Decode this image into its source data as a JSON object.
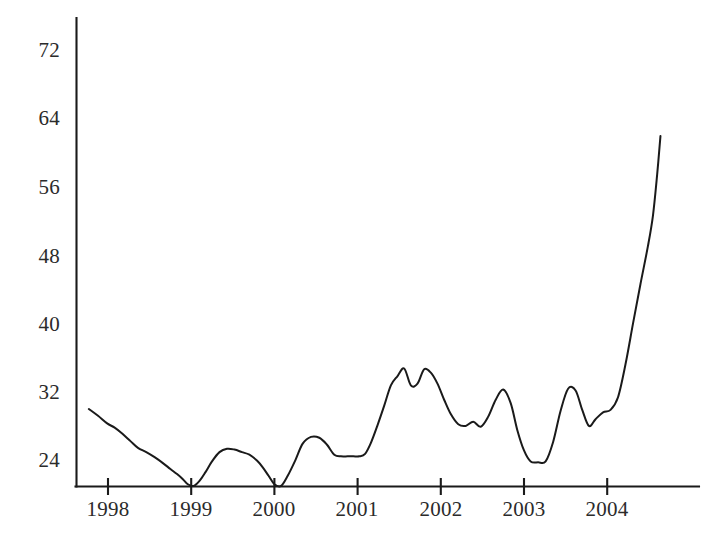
{
  "chart_data": {
    "type": "line",
    "title": "",
    "subtitle": "",
    "xlabel": "",
    "ylabel": "",
    "grid": false,
    "legend": null,
    "xlim": [
      1997.75,
      2004.65
    ],
    "ylim": [
      20.0,
      74.0
    ],
    "y_ticks": [
      24,
      32,
      40,
      48,
      56,
      64,
      72
    ],
    "y_tick_labels": [
      "24",
      "32",
      "40",
      "48",
      "56",
      "64",
      "72"
    ],
    "x_ticks": [
      1998,
      1999,
      2000,
      2001,
      2002,
      2003,
      2004
    ],
    "x_tick_labels": [
      "1998",
      "1999",
      "2000",
      "2001",
      "2002",
      "2003",
      "2004"
    ],
    "line_color": "#1a1a1a",
    "series": [
      {
        "name": "value",
        "x": [
          1997.77,
          1997.88,
          1997.99,
          1998.08,
          1998.17,
          1998.27,
          1998.36,
          1998.46,
          1998.56,
          1998.66,
          1998.75,
          1998.83,
          1998.9,
          1998.96,
          1999.03,
          1999.1,
          1999.17,
          1999.25,
          1999.34,
          1999.43,
          1999.52,
          1999.61,
          1999.7,
          1999.79,
          1999.86,
          1999.93,
          2000.0,
          2000.08,
          2000.16,
          2000.25,
          2000.34,
          2000.44,
          2000.54,
          2000.63,
          2000.72,
          2000.8,
          2000.88,
          2000.95,
          2001.02,
          2001.09,
          2001.16,
          2001.24,
          2001.32,
          2001.4,
          2001.48,
          2001.56,
          2001.64,
          2001.72,
          2001.8,
          2001.88,
          2001.96,
          2002.04,
          2002.12,
          2002.21,
          2002.3,
          2002.39,
          2002.48,
          2002.57,
          2002.66,
          2002.75,
          2002.84,
          2002.92,
          2003.0,
          2003.08,
          2003.17,
          2003.26,
          2003.35,
          2003.44,
          2003.53,
          2003.62,
          2003.7,
          2003.78,
          2003.86,
          2003.95,
          2004.04,
          2004.13,
          2004.22,
          2004.31,
          2004.4,
          2004.49,
          2004.58
        ],
        "y": [
          29.5,
          28.7,
          27.8,
          27.3,
          26.6,
          25.7,
          24.9,
          24.4,
          23.8,
          23.1,
          22.4,
          21.8,
          21.2,
          20.6,
          20.4,
          21.0,
          22.0,
          23.3,
          24.4,
          24.8,
          24.7,
          24.4,
          24.1,
          23.4,
          22.6,
          21.6,
          20.6,
          20.4,
          21.6,
          23.4,
          25.4,
          26.2,
          26.1,
          25.3,
          24.1,
          23.9,
          23.9,
          23.9,
          23.9,
          24.2,
          25.5,
          27.6,
          29.9,
          32.3,
          33.4,
          34.3,
          32.3,
          32.5,
          34.2,
          33.8,
          32.5,
          30.6,
          28.9,
          27.7,
          27.5,
          28.0,
          27.4,
          28.6,
          30.6,
          31.8,
          30.2,
          27.0,
          24.6,
          23.3,
          23.2,
          23.3,
          25.6,
          29.3,
          31.9,
          31.7,
          29.4,
          27.5,
          28.3,
          29.1,
          29.4,
          30.9,
          34.8,
          39.6,
          44.3,
          48.8,
          52.4
        ],
        "x_extra": [
          2004.62,
          2004.66,
          2004.7
        ],
        "y_extra": [
          56.2,
          58.1,
          62.0
        ]
      }
    ],
    "full_x": [
      1997.77,
      1997.88,
      1997.99,
      1998.08,
      1998.17,
      1998.27,
      1998.36,
      1998.46,
      1998.56,
      1998.66,
      1998.75,
      1998.83,
      1998.9,
      1998.96,
      1999.03,
      1999.1,
      1999.17,
      1999.25,
      1999.34,
      1999.43,
      1999.52,
      1999.61,
      1999.7,
      1999.79,
      1999.86,
      1999.93,
      2000.0,
      2000.08,
      2000.16,
      2000.25,
      2000.34,
      2000.44,
      2000.54,
      2000.63,
      2000.72,
      2000.8,
      2000.88,
      2000.95,
      2001.02,
      2001.09,
      2001.16,
      2001.24,
      2001.32,
      2001.4,
      2001.48,
      2001.56,
      2001.64,
      2001.72,
      2001.8,
      2001.88,
      2001.96,
      2002.04,
      2002.12,
      2002.21,
      2002.3,
      2002.39,
      2002.48,
      2002.57,
      2002.66,
      2002.75,
      2002.84,
      2002.92,
      2003.0,
      2003.08,
      2003.17,
      2003.26,
      2003.35,
      2003.44,
      2003.53,
      2003.62,
      2003.7,
      2003.78,
      2003.86,
      2003.95,
      2004.04,
      2004.13,
      2004.22,
      2004.31,
      2004.4,
      2004.49,
      2004.55,
      2004.6,
      2004.64
    ],
    "full_y": [
      29.5,
      28.7,
      27.8,
      27.3,
      26.6,
      25.7,
      24.9,
      24.4,
      23.8,
      23.1,
      22.4,
      21.8,
      21.2,
      20.6,
      20.4,
      21.0,
      22.0,
      23.3,
      24.4,
      24.8,
      24.7,
      24.4,
      24.1,
      23.4,
      22.6,
      21.6,
      20.6,
      20.4,
      21.6,
      23.4,
      25.4,
      26.2,
      26.1,
      25.3,
      24.1,
      23.9,
      23.9,
      23.9,
      23.9,
      24.2,
      25.5,
      27.6,
      29.9,
      32.3,
      33.4,
      34.3,
      32.3,
      32.5,
      34.2,
      33.8,
      32.5,
      30.6,
      28.9,
      27.7,
      27.5,
      28.0,
      27.4,
      28.6,
      30.6,
      31.8,
      30.2,
      27.0,
      24.6,
      23.3,
      23.2,
      23.3,
      25.6,
      29.3,
      31.9,
      31.7,
      29.4,
      27.5,
      28.3,
      29.1,
      29.4,
      30.9,
      34.8,
      39.6,
      44.3,
      48.8,
      52.4,
      57.2,
      61.8,
      66.0,
      72.3
    ],
    "notes": {
      "start_value": 29.5,
      "end_value": 72.3,
      "minimum_value": 20.4,
      "maximum_value": 72.3
    }
  }
}
